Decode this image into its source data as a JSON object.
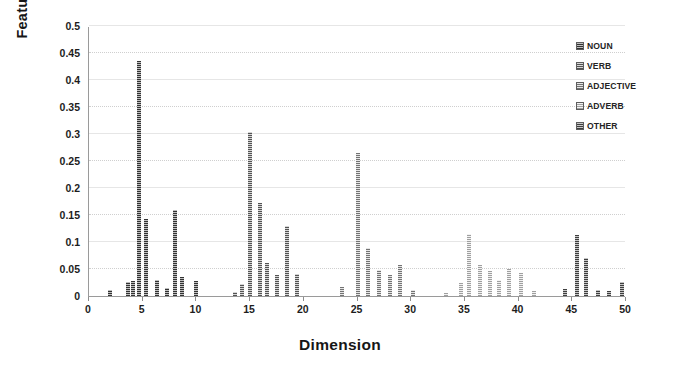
{
  "chart_data": {
    "type": "bar",
    "title": "",
    "xlabel": "Dimension",
    "ylabel": "Feature Value",
    "xlim": [
      0,
      50
    ],
    "ylim": [
      0,
      0.5
    ],
    "ytick_values": [
      0,
      0.05,
      0.1,
      0.15,
      0.2,
      0.25,
      0.3,
      0.35,
      0.4,
      0.45,
      0.5
    ],
    "ytick_labels": [
      "0",
      "0.05",
      "0.1",
      "0.15",
      "0.2",
      "0.25",
      "0.3",
      "0.35",
      "0.4",
      "0.45",
      "0.5"
    ],
    "xtick_values": [
      0,
      5,
      10,
      15,
      20,
      25,
      30,
      35,
      40,
      45,
      50
    ],
    "xtick_labels": [
      "0",
      "5",
      "10",
      "15",
      "20",
      "25",
      "30",
      "35",
      "40",
      "45",
      "50"
    ],
    "grid": true,
    "grid_axis": "y",
    "legend_position": "top-right",
    "legend": [
      "NOUN",
      "VERB",
      "ADJECTIVE",
      "ADVERB",
      "OTHER"
    ],
    "series_colors": {
      "NOUN": "#6f6f6f",
      "VERB": "#8a8a8a",
      "ADJECTIVE": "#a5a5a5",
      "ADVERB": "#c2c2c2",
      "OTHER": "#767676"
    },
    "bars": [
      {
        "x": 2,
        "y": 0.012,
        "series": "NOUN"
      },
      {
        "x": 3.6,
        "y": 0.026,
        "series": "NOUN"
      },
      {
        "x": 4.1,
        "y": 0.027,
        "series": "NOUN"
      },
      {
        "x": 4.7,
        "y": 0.435,
        "series": "NOUN"
      },
      {
        "x": 5.3,
        "y": 0.142,
        "series": "NOUN"
      },
      {
        "x": 6.3,
        "y": 0.03,
        "series": "NOUN"
      },
      {
        "x": 7.3,
        "y": 0.014,
        "series": "NOUN"
      },
      {
        "x": 8.0,
        "y": 0.16,
        "series": "NOUN"
      },
      {
        "x": 8.7,
        "y": 0.035,
        "series": "NOUN"
      },
      {
        "x": 10.0,
        "y": 0.028,
        "series": "NOUN"
      },
      {
        "x": 13.6,
        "y": 0.007,
        "series": "VERB"
      },
      {
        "x": 14.2,
        "y": 0.022,
        "series": "VERB"
      },
      {
        "x": 15.0,
        "y": 0.303,
        "series": "VERB"
      },
      {
        "x": 15.9,
        "y": 0.172,
        "series": "VERB"
      },
      {
        "x": 16.6,
        "y": 0.062,
        "series": "VERB"
      },
      {
        "x": 17.5,
        "y": 0.038,
        "series": "VERB"
      },
      {
        "x": 18.4,
        "y": 0.13,
        "series": "VERB"
      },
      {
        "x": 19.4,
        "y": 0.04,
        "series": "VERB"
      },
      {
        "x": 23.6,
        "y": 0.016,
        "series": "ADJECTIVE"
      },
      {
        "x": 25.0,
        "y": 0.264,
        "series": "ADJECTIVE"
      },
      {
        "x": 26.0,
        "y": 0.089,
        "series": "ADJECTIVE"
      },
      {
        "x": 27.0,
        "y": 0.048,
        "series": "ADJECTIVE"
      },
      {
        "x": 28.0,
        "y": 0.038,
        "series": "ADJECTIVE"
      },
      {
        "x": 29.0,
        "y": 0.058,
        "series": "ADJECTIVE"
      },
      {
        "x": 30.2,
        "y": 0.012,
        "series": "ADJECTIVE"
      },
      {
        "x": 33.2,
        "y": 0.006,
        "series": "ADVERB"
      },
      {
        "x": 34.6,
        "y": 0.024,
        "series": "ADVERB"
      },
      {
        "x": 35.4,
        "y": 0.115,
        "series": "ADVERB"
      },
      {
        "x": 36.4,
        "y": 0.058,
        "series": "ADVERB"
      },
      {
        "x": 37.3,
        "y": 0.046,
        "series": "ADVERB"
      },
      {
        "x": 38.2,
        "y": 0.03,
        "series": "ADVERB"
      },
      {
        "x": 39.1,
        "y": 0.05,
        "series": "ADVERB"
      },
      {
        "x": 40.2,
        "y": 0.042,
        "series": "ADVERB"
      },
      {
        "x": 41.4,
        "y": 0.009,
        "series": "ADVERB"
      },
      {
        "x": 44.3,
        "y": 0.013,
        "series": "OTHER"
      },
      {
        "x": 45.4,
        "y": 0.113,
        "series": "OTHER"
      },
      {
        "x": 46.3,
        "y": 0.07,
        "series": "OTHER"
      },
      {
        "x": 47.4,
        "y": 0.012,
        "series": "OTHER"
      },
      {
        "x": 48.4,
        "y": 0.01,
        "series": "OTHER"
      },
      {
        "x": 49.6,
        "y": 0.026,
        "series": "OTHER"
      }
    ]
  }
}
